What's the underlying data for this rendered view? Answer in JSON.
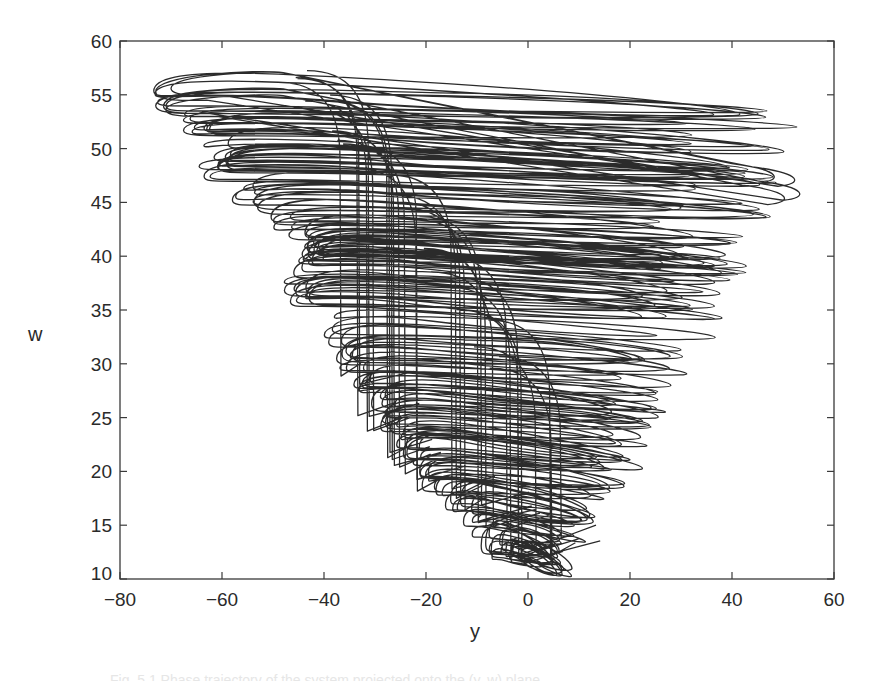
{
  "chart_data": {
    "type": "line",
    "title": "",
    "xlabel": "y",
    "ylabel": "w",
    "xlim": [
      -80,
      60
    ],
    "ylim": [
      10,
      60
    ],
    "xticks": [
      -80,
      -60,
      -40,
      -20,
      0,
      20,
      40,
      60
    ],
    "yticks": [
      10,
      15,
      20,
      25,
      30,
      35,
      40,
      45,
      50,
      55,
      60
    ],
    "grid": false,
    "legend": null,
    "line_color": "#2b2b2b",
    "envelope": {
      "w_levels": [
        55,
        54,
        51,
        49,
        48,
        46,
        45,
        44,
        41,
        40,
        38,
        37,
        36,
        35,
        34,
        33,
        32,
        31,
        30,
        29,
        28,
        27,
        26,
        25,
        24,
        23,
        22,
        21,
        20,
        19,
        18,
        17,
        16,
        15,
        14,
        13,
        12
      ],
      "y_left": [
        -73,
        -73,
        -62,
        -60,
        -64,
        -54,
        -56,
        -50,
        -44,
        -42,
        -48,
        -46,
        -44,
        -42,
        -40,
        -40,
        -38,
        -36,
        -36,
        -34,
        -32,
        -30,
        -28,
        -28,
        -26,
        -25,
        -24,
        -24,
        -22,
        -20,
        -18,
        -14,
        -12,
        -10,
        -8,
        -6,
        -4
      ],
      "y_right": [
        54,
        55,
        52,
        50,
        48,
        47,
        50,
        44,
        46,
        46,
        42,
        40,
        40,
        38,
        36,
        38,
        34,
        32,
        32,
        30,
        30,
        28,
        28,
        26,
        26,
        24,
        22,
        22,
        20,
        20,
        20,
        16,
        14,
        10,
        8,
        6,
        4
      ]
    },
    "vertical_strands": {
      "y_positions": [
        -35,
        -33,
        -30,
        -28,
        -26,
        -24,
        -20,
        -16,
        -12,
        -10,
        -7,
        -5,
        -3,
        0,
        3,
        5
      ],
      "w_top": [
        55,
        55,
        54,
        53,
        52,
        50,
        48,
        46,
        44,
        42,
        40,
        38,
        36,
        34,
        32,
        30
      ],
      "w_bottom": [
        28,
        26,
        24,
        22,
        21,
        20,
        19,
        18,
        17,
        16,
        15,
        14,
        13,
        12,
        12,
        13
      ]
    },
    "w_min": 11,
    "w_max": 57,
    "y_min": -73,
    "y_max": 55
  },
  "axes": {
    "xtick_labels": [
      "−80",
      "−60",
      "−40",
      "−20",
      "0",
      "20",
      "40",
      "60"
    ],
    "ytick_labels": [
      "10",
      "15",
      "20",
      "25",
      "30",
      "35",
      "40",
      "45",
      "50",
      "55",
      "60"
    ],
    "xlabel": "y",
    "ylabel": "w"
  },
  "caption": "Fig. 5.1  Phase trajectory of the system projected onto the (y, w) plane"
}
